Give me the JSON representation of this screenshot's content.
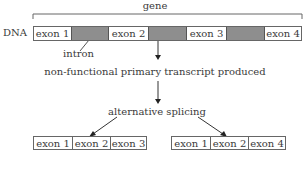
{
  "diagram": {
    "gene_label": "gene",
    "dna_label": "DNA",
    "dna_segments": [
      {
        "type": "exon",
        "label": "exon 1"
      },
      {
        "type": "intron",
        "label": ""
      },
      {
        "type": "exon",
        "label": "exon 2"
      },
      {
        "type": "intron",
        "label": ""
      },
      {
        "type": "exon",
        "label": "exon 3"
      },
      {
        "type": "intron",
        "label": ""
      },
      {
        "type": "exon",
        "label": "exon 4"
      }
    ],
    "intron_label": "intron",
    "step1": "non-functional primary transcript produced",
    "step2": "alternative splicing",
    "mrna_left": [
      "exon 1",
      "exon 2",
      "exon 3"
    ],
    "mrna_right": [
      "exon 1",
      "exon 2",
      "exon 4"
    ],
    "colors": {
      "intron": "#8e8e8e",
      "line": "#555555",
      "text": "#3a3a3a"
    }
  }
}
